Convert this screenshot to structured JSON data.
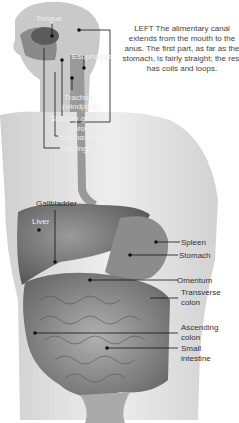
{
  "caption": "LEFT  The alimentary canal extends from the mouth to the anus. The first part, as far as the stomach, is fairly straight; the rest has coils and loops.",
  "labels": {
    "tongue": "Tongue",
    "esophagus": "Esophagus",
    "trachea_1": "Trachea",
    "trachea_2": "(windpipe)",
    "salivary": "Salivary glands:",
    "parotoid": "parotoid",
    "submaxillary": "submaxillary",
    "sublingual": "sublingual",
    "gallbladder": "Gallbladder",
    "liver": "Liver",
    "spleen": "Spleen",
    "stomach": "Stomach",
    "omentum": "Omentum",
    "transverse_1": "Transverse",
    "transverse_2": "colon",
    "ascending_1": "Ascending",
    "ascending_2": "colon",
    "small_1": "Small",
    "small_2": "intestine"
  },
  "colors": {
    "skin": "#d8d8d8",
    "organ_dark": "#6a6a6a",
    "organ_mid": "#8c8c8c",
    "leader": "#111111"
  }
}
